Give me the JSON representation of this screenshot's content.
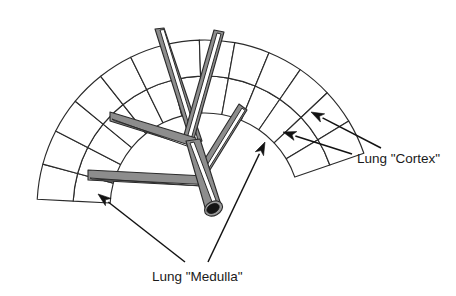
{
  "figure": {
    "background_color": "#ffffff",
    "ink_color": "#1a1a1a",
    "tube_fill_color": "#8d8d8d",
    "cell_fill_color": "#ffffff",
    "width": 456,
    "height": 296
  },
  "labels": {
    "cortex": {
      "text": "Lung \"Cortex\"",
      "x": 357,
      "y": 163
    },
    "medulla": {
      "text": "Lung \"Medulla\"",
      "x": 152,
      "y": 281
    }
  },
  "annotations": [
    {
      "name": "cortex-arrow-upper",
      "label": "Lung \"Cortex\"",
      "from_x": 381,
      "from_y": 148,
      "to_x": 311,
      "to_y": 112
    },
    {
      "name": "cortex-arrow-lower",
      "label": "Lung \"Cortex\"",
      "from_x": 352,
      "from_y": 154,
      "to_x": 283,
      "to_y": 132
    },
    {
      "name": "medulla-arrow-left",
      "label": "Lung \"Medulla\"",
      "from_x": 185,
      "from_y": 262,
      "to_x": 98,
      "to_y": 194
    },
    {
      "name": "medulla-arrow-right",
      "label": "Lung \"Medulla\"",
      "from_x": 208,
      "from_y": 262,
      "to_x": 265,
      "to_y": 142
    }
  ],
  "cortex": {
    "name": "Lung \"Cortex\"",
    "description": "Two concentric rings of quadrilateral cells forming an arc",
    "center_x": 205,
    "center_y": 208,
    "radii": [
      95,
      132,
      168
    ],
    "start_angle_deg": 183,
    "end_angle_deg": 341,
    "ring_count": 2,
    "cells_per_ring": 13
  },
  "medulla": {
    "name": "Lung \"Medulla\"",
    "description": "Branching tubular airway tree with open trunk",
    "branch_count": 4,
    "trunk_open_end": true
  }
}
